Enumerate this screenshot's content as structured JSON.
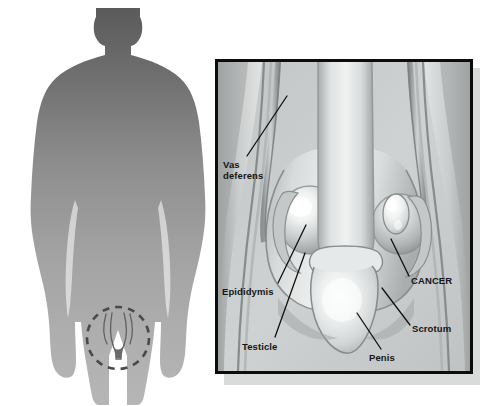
{
  "figure": {
    "type": "medical-illustration",
    "background_color": "#ffffff",
    "width": 485,
    "height": 406
  },
  "silhouette": {
    "name": "male-body-silhouette",
    "description": "Gray gradient front-facing male body outline",
    "gradient_top_color": "#5a5a5a",
    "gradient_bottom_color": "#b4b4b4",
    "highlight_marker": {
      "name": "groin-highlight-circle",
      "style": "dashed-circle",
      "color": "#4a4a4a",
      "center_x": 118,
      "center_y": 338,
      "radius": 31
    }
  },
  "detail_panel": {
    "name": "anatomy-detail-panel",
    "border_color": "#0c0c0c",
    "background_color": "#c8cbcb",
    "shadow_color": "#d9dbdb",
    "tumor_color": "#f2f4f4"
  },
  "labels": [
    {
      "id": "vas-deferens",
      "text": "Vas\ndeferens",
      "lines": [
        "Vas",
        "deferens"
      ]
    },
    {
      "id": "epididymis",
      "text": "Epididymis",
      "lines": [
        "Epididymis"
      ]
    },
    {
      "id": "testicle",
      "text": "Testicle",
      "lines": [
        "Testicle"
      ]
    },
    {
      "id": "penis",
      "text": "Penis",
      "lines": [
        "Penis"
      ]
    },
    {
      "id": "scrotum",
      "text": "Scrotum",
      "lines": [
        "Scrotum"
      ]
    },
    {
      "id": "cancer",
      "text": "CANCER",
      "lines": [
        "CANCER"
      ]
    }
  ],
  "label_text": {
    "vas_deferens_line1": "Vas",
    "vas_deferens_line2": "deferens",
    "epididymis": "Epididymis",
    "testicle": "Testicle",
    "penis": "Penis",
    "scrotum": "Scrotum",
    "cancer": "CANCER"
  }
}
